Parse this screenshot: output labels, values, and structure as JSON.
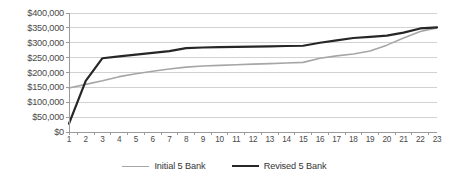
{
  "chart_data": {
    "type": "line",
    "title": "",
    "xlabel": "",
    "ylabel": "",
    "grid": true,
    "legend_position": "bottom",
    "x": [
      1,
      2,
      3,
      4,
      5,
      6,
      7,
      8,
      9,
      10,
      11,
      12,
      13,
      14,
      15,
      16,
      17,
      18,
      19,
      20,
      21,
      22,
      23
    ],
    "categories": [
      "1",
      "2",
      "3",
      "4",
      "5",
      "6",
      "7",
      "8",
      "9",
      "10",
      "11",
      "12",
      "13",
      "14",
      "15",
      "16",
      "17",
      "18",
      "19",
      "20",
      "21",
      "22",
      "23"
    ],
    "ylim": [
      0,
      400000
    ],
    "ytick_values": [
      0,
      50000,
      100000,
      150000,
      200000,
      250000,
      300000,
      350000,
      400000
    ],
    "ytick_labels": [
      "$0",
      "$50,000",
      "$100,000",
      "$150,000",
      "$200,000",
      "$250,000",
      "$300,000",
      "$350,000",
      "$400,000"
    ],
    "series": [
      {
        "name": "Initial  5 Bank",
        "color": "#a6a6a6",
        "width": 1.6,
        "values": [
          148000,
          160000,
          172000,
          186000,
          196000,
          204000,
          212000,
          218000,
          222000,
          224000,
          226000,
          228000,
          230000,
          232000,
          234000,
          248000,
          256000,
          262000,
          272000,
          292000,
          316000,
          338000,
          350000
        ]
      },
      {
        "name": "Revised 5 Bank",
        "color": "#262626",
        "width": 2.2,
        "values": [
          28000,
          172000,
          248000,
          254000,
          260000,
          266000,
          272000,
          282000,
          284000,
          285000,
          286000,
          287000,
          288000,
          289000,
          290000,
          300000,
          308000,
          316000,
          320000,
          324000,
          334000,
          348000,
          352000
        ]
      }
    ]
  },
  "legend": {
    "items": [
      {
        "label": "Initial  5 Bank",
        "color": "#a6a6a6"
      },
      {
        "label": "Revised 5 Bank",
        "color": "#262626"
      }
    ]
  },
  "plot": {
    "left": 69,
    "right": 437,
    "top": 13,
    "bottom": 132,
    "axis_color": "#9a9a9a",
    "grid_color": "#d2d2d2",
    "background": "#ffffff"
  }
}
